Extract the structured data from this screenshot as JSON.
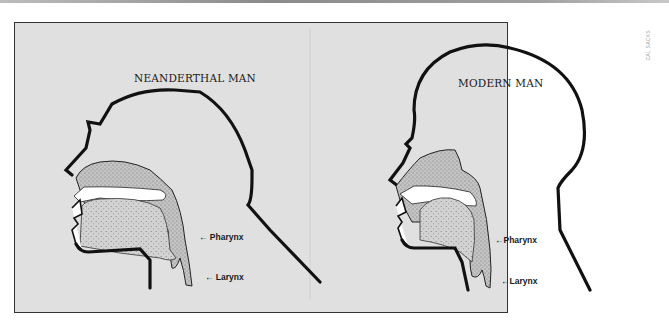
{
  "figure": {
    "credit": "CAL SACKS",
    "panels": [
      {
        "id": "neanderthal",
        "title": "NEANDERTHAL MAN",
        "labels": {
          "pharynx": "← Pharynx",
          "larynx": "← Larynx"
        }
      },
      {
        "id": "modern",
        "title": "MODERN MAN",
        "labels": {
          "pharynx": "←Pharynx",
          "larynx": "←Larynx"
        }
      }
    ],
    "colors": {
      "background": "#e0e0e0",
      "outline": "#111111",
      "stipple": "#b0b0b0",
      "cavity": "#ffffff"
    }
  }
}
